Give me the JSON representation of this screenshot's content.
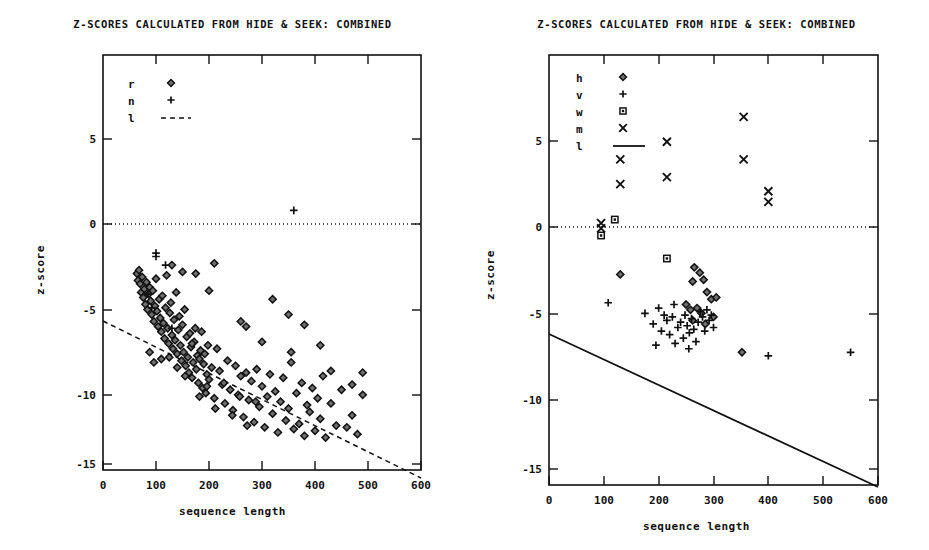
{
  "figure": {
    "width": 929,
    "height": 550,
    "background": "#ffffff",
    "ink_color": "#111111"
  },
  "chart_data": [
    {
      "panel_id": "left",
      "type": "scatter",
      "title": "Z-SCORES CALCULATED FROM HIDE & SEEK: COMBINED",
      "xlabel": "sequence length",
      "ylabel": "z-score",
      "xlim": [
        0,
        600
      ],
      "ylim": [
        -16.5,
        7.8
      ],
      "xticks": [
        0,
        100,
        200,
        300,
        400,
        500,
        600
      ],
      "xticklabels": [
        "0",
        "100",
        "200",
        "300",
        "400",
        "500",
        "600"
      ],
      "yticks": [
        5,
        0,
        -5,
        -10,
        -15
      ],
      "yticklabels": [
        "5",
        "0",
        "-5",
        "-10",
        "-15"
      ],
      "grid": false,
      "legend_position": "upper-left-inside",
      "legend": [
        {
          "label": "r",
          "marker": "diamond"
        },
        {
          "label": "n",
          "marker": "plus"
        },
        {
          "label": "l",
          "marker": "dashed-line"
        }
      ],
      "annotations": [
        {
          "name": "zero-reference-line",
          "style": "dotted",
          "y": 0,
          "x_from": 0,
          "x_to": 600
        },
        {
          "name": "regression-line",
          "style": "dashed",
          "x_from": 0,
          "y_from": -5.7,
          "x_to": 600,
          "y_to": -14.9
        }
      ],
      "series": [
        {
          "name": "r",
          "marker": "diamond",
          "points": [
            [
              64,
              -5.0
            ],
            [
              66,
              -5.4
            ],
            [
              68,
              -4.8
            ],
            [
              70,
              -5.6
            ],
            [
              72,
              -6.1
            ],
            [
              74,
              -5.2
            ],
            [
              76,
              -6.4
            ],
            [
              78,
              -5.9
            ],
            [
              80,
              -6.8
            ],
            [
              82,
              -5.5
            ],
            [
              84,
              -7.1
            ],
            [
              86,
              -6.2
            ],
            [
              88,
              -5.8
            ],
            [
              90,
              -6.6
            ],
            [
              92,
              -7.4
            ],
            [
              94,
              -6.0
            ],
            [
              96,
              -7.8
            ],
            [
              98,
              -6.9
            ],
            [
              100,
              -5.3
            ],
            [
              102,
              -7.2
            ],
            [
              104,
              -8.1
            ],
            [
              106,
              -6.5
            ],
            [
              108,
              -7.6
            ],
            [
              110,
              -8.4
            ],
            [
              112,
              -6.3
            ],
            [
              114,
              -7.9
            ],
            [
              116,
              -8.8
            ],
            [
              118,
              -7.0
            ],
            [
              120,
              -5.1
            ],
            [
              122,
              -8.2
            ],
            [
              124,
              -9.1
            ],
            [
              126,
              -7.3
            ],
            [
              128,
              -6.7
            ],
            [
              130,
              -8.6
            ],
            [
              132,
              -9.4
            ],
            [
              134,
              -7.7
            ],
            [
              136,
              -8.9
            ],
            [
              138,
              -6.1
            ],
            [
              140,
              -9.7
            ],
            [
              142,
              -8.3
            ],
            [
              144,
              -7.5
            ],
            [
              146,
              -9.2
            ],
            [
              148,
              -10.1
            ],
            [
              150,
              -8.0
            ],
            [
              152,
              -9.6
            ],
            [
              154,
              -7.1
            ],
            [
              156,
              -10.4
            ],
            [
              158,
              -8.7
            ],
            [
              160,
              -9.9
            ],
            [
              162,
              -10.8
            ],
            [
              164,
              -8.5
            ],
            [
              166,
              -9.3
            ],
            [
              168,
              -11.1
            ],
            [
              170,
              -10.2
            ],
            [
              172,
              -9.0
            ],
            [
              174,
              -8.2
            ],
            [
              176,
              -10.6
            ],
            [
              178,
              -9.8
            ],
            [
              180,
              -11.4
            ],
            [
              182,
              -10.0
            ],
            [
              184,
              -9.5
            ],
            [
              186,
              -8.4
            ],
            [
              188,
              -11.7
            ],
            [
              190,
              -10.3
            ],
            [
              192,
              -9.7
            ],
            [
              194,
              -12.0
            ],
            [
              196,
              -10.9
            ],
            [
              198,
              -9.2
            ],
            [
              200,
              -11.2
            ],
            [
              205,
              -10.5
            ],
            [
              210,
              -12.3
            ],
            [
              215,
              -9.4
            ],
            [
              220,
              -10.7
            ],
            [
              225,
              -11.5
            ],
            [
              230,
              -12.6
            ],
            [
              235,
              -10.1
            ],
            [
              240,
              -11.8
            ],
            [
              245,
              -13.0
            ],
            [
              250,
              -10.4
            ],
            [
              255,
              -12.1
            ],
            [
              260,
              -11.0
            ],
            [
              265,
              -13.4
            ],
            [
              270,
              -10.8
            ],
            [
              275,
              -12.4
            ],
            [
              280,
              -11.3
            ],
            [
              285,
              -13.7
            ],
            [
              290,
              -10.6
            ],
            [
              295,
              -12.8
            ],
            [
              300,
              -11.6
            ],
            [
              305,
              -14.0
            ],
            [
              310,
              -12.2
            ],
            [
              315,
              -10.9
            ],
            [
              320,
              -13.2
            ],
            [
              325,
              -11.9
            ],
            [
              330,
              -14.3
            ],
            [
              335,
              -12.5
            ],
            [
              340,
              -11.1
            ],
            [
              345,
              -13.6
            ],
            [
              350,
              -12.9
            ],
            [
              355,
              -10.2
            ],
            [
              360,
              -14.1
            ],
            [
              365,
              -12.0
            ],
            [
              370,
              -13.8
            ],
            [
              375,
              -11.4
            ],
            [
              380,
              -14.5
            ],
            [
              385,
              -12.7
            ],
            [
              390,
              -13.1
            ],
            [
              395,
              -11.7
            ],
            [
              400,
              -14.2
            ],
            [
              405,
              -12.3
            ],
            [
              410,
              -13.5
            ],
            [
              415,
              -11.0
            ],
            [
              420,
              -14.6
            ],
            [
              430,
              -12.6
            ],
            [
              440,
              -13.9
            ],
            [
              450,
              -11.8
            ],
            [
              460,
              -14.0
            ],
            [
              470,
              -13.3
            ],
            [
              480,
              -14.4
            ],
            [
              490,
              -12.1
            ],
            [
              130,
              -4.5
            ],
            [
              150,
              -4.9
            ],
            [
              175,
              -5.0
            ],
            [
              200,
              -6.0
            ],
            [
              210,
              -4.4
            ],
            [
              260,
              -7.8
            ],
            [
              270,
              -8.1
            ],
            [
              300,
              -9.0
            ],
            [
              320,
              -6.5
            ],
            [
              350,
              -7.4
            ],
            [
              355,
              -9.6
            ],
            [
              380,
              -8.0
            ],
            [
              410,
              -9.2
            ],
            [
              430,
              -10.7
            ],
            [
              470,
              -11.5
            ],
            [
              490,
              -10.8
            ],
            [
              88,
              -9.6
            ],
            [
              96,
              -10.2
            ],
            [
              110,
              -10.0
            ],
            [
              125,
              -9.9
            ],
            [
              140,
              -10.5
            ],
            [
              155,
              -11.0
            ],
            [
              168,
              -9.1
            ],
            [
              182,
              -12.2
            ],
            [
              196,
              -11.6
            ],
            [
              212,
              -12.9
            ],
            [
              228,
              -11.4
            ],
            [
              244,
              -13.3
            ],
            [
              258,
              -12.2
            ],
            [
              272,
              -13.9
            ],
            [
              288,
              -12.5
            ]
          ]
        },
        {
          "name": "n",
          "marker": "plus",
          "points": [
            [
              360,
              -1.3
            ],
            [
              100,
              -3.8
            ],
            [
              100,
              -4.0
            ],
            [
              118,
              -4.5
            ],
            [
              85,
              -6.2
            ],
            [
              92,
              -7.0
            ],
            [
              130,
              -8.2
            ]
          ]
        }
      ]
    },
    {
      "panel_id": "right",
      "type": "scatter",
      "title": "Z-SCORES CALCULATED FROM HIDE & SEEK: COMBINED",
      "xlabel": "sequence length",
      "ylabel": "z-score",
      "xlim": [
        0,
        600
      ],
      "ylim": [
        -16.5,
        7.8
      ],
      "xticks": [
        0,
        100,
        200,
        300,
        400,
        500,
        600
      ],
      "xticklabels": [
        "0",
        "100",
        "200",
        "300",
        "400",
        "500",
        "600"
      ],
      "yticks": [
        5,
        0,
        -5,
        -10,
        -15
      ],
      "yticklabels": [
        "5",
        "0",
        "-5",
        "-10",
        "-15"
      ],
      "grid": false,
      "legend_position": "upper-left-inside",
      "legend": [
        {
          "label": "h",
          "marker": "diamond"
        },
        {
          "label": "v",
          "marker": "plus"
        },
        {
          "label": "w",
          "marker": "square"
        },
        {
          "label": "m",
          "marker": "ex"
        },
        {
          "label": "l",
          "marker": "solid-line"
        }
      ],
      "annotations": [
        {
          "name": "zero-reference-line",
          "style": "dotted",
          "y": 0,
          "x_from": 0,
          "x_to": 600
        },
        {
          "name": "threshold-line",
          "style": "solid",
          "x_from": 0,
          "y_from": -6.2,
          "x_to": 600,
          "y_to": -15.1
        }
      ],
      "series": [
        {
          "name": "m",
          "marker": "ex",
          "points": [
            [
              130,
              1.9
            ],
            [
              130,
              0.5
            ],
            [
              215,
              2.9
            ],
            [
              215,
              0.9
            ],
            [
              355,
              4.3
            ],
            [
              355,
              1.9
            ],
            [
              400,
              0.1
            ],
            [
              400,
              -0.5
            ],
            [
              95,
              -1.7
            ],
            [
              95,
              -2.0
            ]
          ]
        },
        {
          "name": "w",
          "marker": "square",
          "points": [
            [
              120,
              -1.5
            ],
            [
              95,
              -2.4
            ],
            [
              215,
              -3.7
            ]
          ]
        },
        {
          "name": "h",
          "marker": "diamond",
          "points": [
            [
              130,
              -4.6
            ],
            [
              265,
              -4.2
            ],
            [
              275,
              -4.5
            ],
            [
              262,
              -5.0
            ],
            [
              282,
              -4.9
            ],
            [
              288,
              -5.6
            ],
            [
              250,
              -6.3
            ],
            [
              258,
              -6.6
            ],
            [
              270,
              -6.5
            ],
            [
              278,
              -6.8
            ],
            [
              296,
              -6.0
            ],
            [
              300,
              -7.0
            ],
            [
              305,
              -5.9
            ],
            [
              262,
              -7.2
            ],
            [
              352,
              -9.0
            ],
            [
              285,
              -7.4
            ]
          ]
        },
        {
          "name": "v",
          "marker": "plus",
          "points": [
            [
              108,
              -6.2
            ],
            [
              175,
              -6.8
            ],
            [
              190,
              -7.4
            ],
            [
              200,
              -6.5
            ],
            [
              205,
              -7.8
            ],
            [
              210,
              -6.9
            ],
            [
              215,
              -7.2
            ],
            [
              220,
              -8.0
            ],
            [
              225,
              -7.0
            ],
            [
              228,
              -6.3
            ],
            [
              235,
              -7.6
            ],
            [
              240,
              -7.3
            ],
            [
              245,
              -8.2
            ],
            [
              248,
              -6.9
            ],
            [
              252,
              -7.5
            ],
            [
              256,
              -7.9
            ],
            [
              260,
              -7.1
            ],
            [
              264,
              -7.7
            ],
            [
              268,
              -8.4
            ],
            [
              272,
              -7.3
            ],
            [
              276,
              -6.7
            ],
            [
              280,
              -7.0
            ],
            [
              284,
              -7.8
            ],
            [
              288,
              -6.6
            ],
            [
              292,
              -7.2
            ],
            [
              296,
              -6.9
            ],
            [
              300,
              -7.6
            ],
            [
              195,
              -8.6
            ],
            [
              255,
              -8.8
            ],
            [
              400,
              -9.2
            ],
            [
              550,
              -9.0
            ],
            [
              230,
              -8.5
            ]
          ]
        }
      ]
    }
  ]
}
